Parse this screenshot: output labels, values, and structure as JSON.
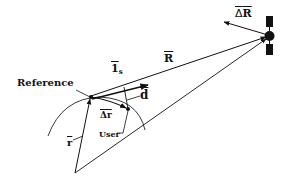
{
  "diagram": {
    "type": "vector-geometry",
    "labels": {
      "reference": "Reference",
      "user": "User",
      "range_vector": "R",
      "unit_vector": "1",
      "unit_vector_subscript": "s",
      "baseline_d": "d",
      "delta_r": "Δr",
      "position_r": "r",
      "delta_R_symbol": "Δ",
      "delta_R_letter": "R"
    },
    "points": {
      "origin": [
        75,
        173
      ],
      "reference": [
        91,
        97
      ],
      "user": [
        128,
        109
      ],
      "satellite": [
        270,
        36
      ]
    },
    "colors": {
      "stroke": "#111111",
      "background": "#ffffff"
    }
  }
}
